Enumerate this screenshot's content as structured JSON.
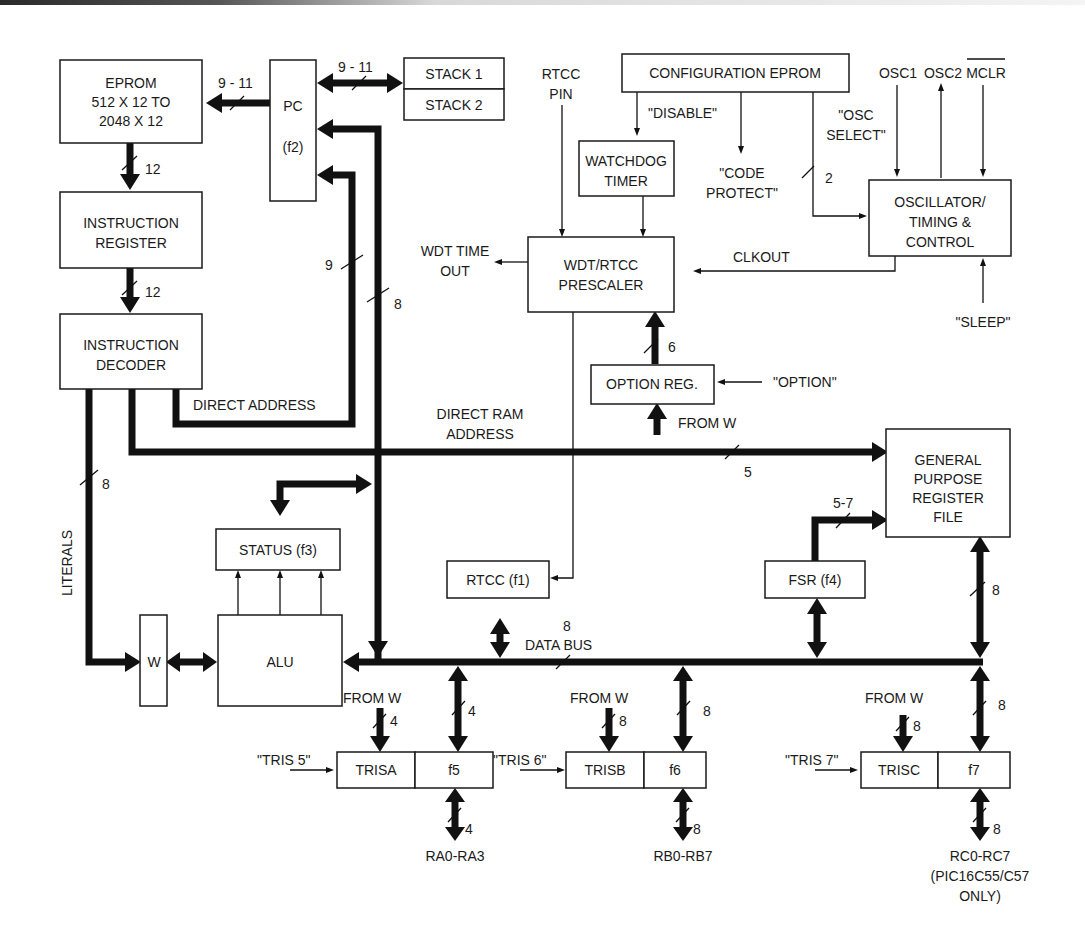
{
  "diagram": {
    "blocks": {
      "eprom": [
        "EPROM",
        "512 X 12 TO",
        "2048 X 12"
      ],
      "pc": [
        "PC",
        "(f2)"
      ],
      "stack1": "STACK 1",
      "stack2": "STACK 2",
      "instruction_register": [
        "INSTRUCTION",
        "REGISTER"
      ],
      "instruction_decoder": [
        "INSTRUCTION",
        "DECODER"
      ],
      "configuration_eprom": "CONFIGURATION EPROM",
      "watchdog_timer": [
        "WATCHDOG",
        "TIMER"
      ],
      "prescaler": [
        "WDT/RTCC",
        "PRESCALER"
      ],
      "oscillator": [
        "OSCILLATOR/",
        "TIMING &",
        "CONTROL"
      ],
      "option_reg": "OPTION REG.",
      "gpr_file": [
        "GENERAL",
        "PURPOSE",
        "REGISTER",
        "FILE"
      ],
      "status": "STATUS (f3)",
      "rtcc": "RTCC (f1)",
      "fsr": "FSR (f4)",
      "w": "W",
      "alu": "ALU",
      "trisa": "TRISA",
      "f5": "f5",
      "trisb": "TRISB",
      "f6": "f6",
      "trisc": "TRISC",
      "f7": "f7"
    },
    "labels": {
      "rtcc_pin": [
        "RTCC",
        "PIN"
      ],
      "osc1": "OSC1",
      "osc2": "OSC2",
      "mclr": "MCLR",
      "disable": "\"DISABLE\"",
      "code_protect": [
        "\"CODE",
        "PROTECT\""
      ],
      "osc_select": [
        "\"OSC",
        "SELECT\""
      ],
      "wdt_timeout": [
        "WDT TIME",
        "OUT"
      ],
      "clkout": "CLKOUT",
      "sleep": "\"SLEEP\"",
      "option": "\"OPTION\"",
      "from_w_option": "FROM W",
      "direct_address": "DIRECT ADDRESS",
      "direct_ram_address": [
        "DIRECT RAM",
        "ADDRESS"
      ],
      "literals": "LITERALS",
      "data_bus": "DATA BUS",
      "from_w_a": "FROM W",
      "from_w_b": "FROM W",
      "from_w_c": "FROM W",
      "tris5": "\"TRIS 5\"",
      "tris6": "\"TRIS 6\"",
      "tris7": "\"TRIS 7\"",
      "port_a": "RA0-RA3",
      "port_b": "RB0-RB7",
      "port_c": [
        "RC0-RC7",
        "(PIC16C55/C57",
        "ONLY)"
      ]
    },
    "bus_widths": {
      "pc_to_eprom": "9 - 11",
      "pc_stack": "9 - 11",
      "eprom_to_ir": "12",
      "ir_to_decoder": "12",
      "direct_address": "9",
      "data_to_pc": "8",
      "literals": "8",
      "direct_ram": "5",
      "option_to_prescaler": "6",
      "osc_select": "2",
      "fsr_to_gpr": "5-7",
      "gpr_to_bus": "8",
      "data_bus": "8",
      "from_w_a": "4",
      "bus_to_f5": "4",
      "port_a": "4",
      "from_w_b": "8",
      "bus_to_f6": "8",
      "port_b": "8",
      "from_w_c": "8",
      "bus_to_f7": "8",
      "port_c": "8"
    }
  }
}
